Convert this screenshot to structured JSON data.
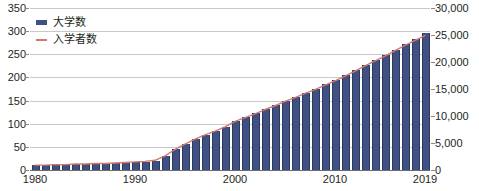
{
  "chart_data": {
    "type": "bar",
    "title": "",
    "subtitle": "",
    "xlabel": "",
    "ylabel": "",
    "grid": true,
    "legend_position": "top-left",
    "x": [
      1980,
      1981,
      1982,
      1983,
      1984,
      1985,
      1986,
      1987,
      1988,
      1989,
      1990,
      1991,
      1992,
      1993,
      1994,
      1995,
      1996,
      1997,
      1998,
      1999,
      2000,
      2001,
      2002,
      2003,
      2004,
      2005,
      2006,
      2007,
      2008,
      2009,
      2010,
      2011,
      2012,
      2013,
      2014,
      2015,
      2016,
      2017,
      2018,
      2019
    ],
    "xtick_labels": [
      "1980",
      "1990",
      "2000",
      "2010",
      "2019"
    ],
    "xtick_values": [
      1980,
      1990,
      2000,
      2010,
      2019
    ],
    "series": [
      {
        "name": "大学数",
        "kind": "bar",
        "axis": "left",
        "color": "#3f5183",
        "values": [
          11,
          11,
          12,
          12,
          13,
          13,
          14,
          14,
          15,
          16,
          17,
          18,
          20,
          30,
          45,
          57,
          67,
          76,
          85,
          94,
          106,
          114,
          123,
          132,
          140,
          149,
          158,
          167,
          176,
          185,
          194,
          205,
          216,
          227,
          238,
          249,
          260,
          272,
          283,
          295
        ]
      },
      {
        "name": "入学者数",
        "kind": "line",
        "axis": "right",
        "color": "#d4796b",
        "values": [
          900,
          900,
          1000,
          1000,
          1100,
          1100,
          1200,
          1200,
          1300,
          1400,
          1500,
          1600,
          1800,
          2600,
          3800,
          4800,
          5700,
          6500,
          7200,
          8000,
          9000,
          9700,
          10400,
          11200,
          11900,
          12700,
          13400,
          14200,
          14900,
          15700,
          16500,
          17400,
          18300,
          19300,
          20200,
          21100,
          22100,
          23100,
          24000,
          24900
        ]
      }
    ],
    "left_axis": {
      "min": 0,
      "max": 350,
      "step": 50,
      "ticks": [
        "0",
        "50",
        "100",
        "150",
        "200",
        "250",
        "300",
        "350"
      ]
    },
    "right_axis": {
      "min": 0,
      "max": 30000,
      "step": 5000,
      "ticks": [
        "0",
        "5,000",
        "10,000",
        "15,000",
        "20,000",
        "25,000",
        "30,000"
      ]
    }
  }
}
